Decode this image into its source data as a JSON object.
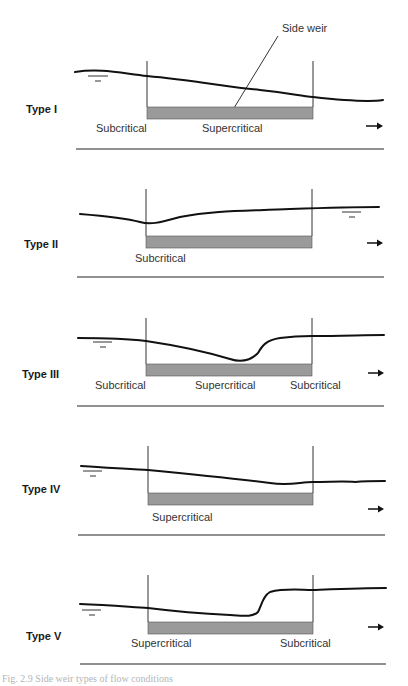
{
  "figure": {
    "callout": {
      "label": "Side weir"
    },
    "flow_direction": "right",
    "panels": [
      {
        "type_label": "Type I",
        "regimes": [
          "Subcritical",
          "Supercritical"
        ]
      },
      {
        "type_label": "Type II",
        "regimes": [
          "Subcritical"
        ]
      },
      {
        "type_label": "Type III",
        "regimes": [
          "Subcritical",
          "Supercritical",
          "Subcritical"
        ]
      },
      {
        "type_label": "Type IV",
        "regimes": [
          "Supercritical"
        ]
      },
      {
        "type_label": "Type V",
        "regimes": [
          "Supercritical",
          "Subcritical"
        ]
      }
    ],
    "caption": "Fig. 2.9  Side weir types of flow conditions"
  },
  "colors": {
    "weir_fill": "#9a9a9a",
    "line": "#111111",
    "caption": "#b5b5b5"
  }
}
